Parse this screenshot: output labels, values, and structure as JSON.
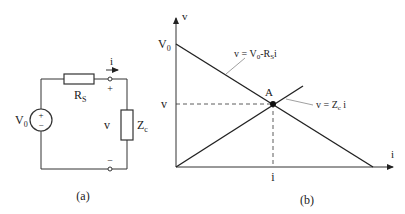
{
  "circuit": {
    "source_label": "V",
    "source_sub": "0",
    "source_plus": "+",
    "source_minus": "−",
    "resistor_label": "R",
    "resistor_sub": "S",
    "current_label": "i",
    "terminal_plus": "+",
    "terminal_minus": "−",
    "voltage_label": "v",
    "load_label": "Z",
    "load_sub": "c",
    "caption": "(a)"
  },
  "graph": {
    "y_axis_label": "v",
    "x_axis_label": "i",
    "v0_label": "V",
    "v0_sub": "0",
    "v_tick_label": "v",
    "i_tick_label": "i",
    "point_label": "A",
    "line1_eq_prefix": "v = V",
    "line1_eq_sub0": "0",
    "line1_eq_mid": "-R",
    "line1_eq_subS": "S",
    "line1_eq_suffix": "i",
    "line2_eq_prefix": "v = Z",
    "line2_eq_sub": "c",
    "line2_eq_suffix": " i",
    "caption": "(b)"
  },
  "colors": {
    "line": "#222222",
    "leader": "#888888"
  }
}
